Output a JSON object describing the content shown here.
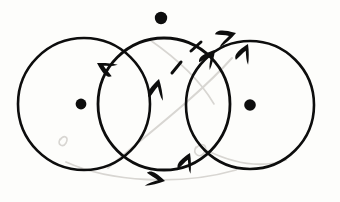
{
  "figure": {
    "kind": "hand-drawn-diagram",
    "width": 340,
    "height": 202,
    "background_color": "#fdfdfb",
    "ink_color": "#0d0d0d",
    "ghost_color": "#d8d6d2",
    "stroke_width": 2.6
  },
  "circles": [
    {
      "id": "left-circle",
      "label": "left circle",
      "cx": 84,
      "cy": 104,
      "r": 66,
      "stroke_width": 2.6
    },
    {
      "id": "middle-circle",
      "label": "middle circle",
      "cx": 164,
      "cy": 104,
      "r": 66,
      "stroke_width": 2.8
    },
    {
      "id": "right-circle",
      "label": "right circle",
      "cx": 250,
      "cy": 105,
      "r": 64,
      "stroke_width": 2.6
    }
  ],
  "dots": [
    {
      "id": "left-center-dot",
      "label": "left circle center point",
      "cx": 81,
      "cy": 104,
      "r": 5.4
    },
    {
      "id": "top-dot",
      "label": "top basepoint above middle circle",
      "cx": 161,
      "cy": 18,
      "r": 6.2
    },
    {
      "id": "right-center-dot",
      "label": "right circle center point",
      "cx": 250,
      "cy": 105,
      "r": 5.8
    }
  ],
  "arrowheads": [
    {
      "id": "arrow-upper-left",
      "label": "arrowhead on middle circle upper-left arc pointing down-left",
      "x": 97,
      "y": 63,
      "angle_deg": 218,
      "size": 15
    },
    {
      "id": "arrow-center-up",
      "label": "arrowhead on middle circle inner arc pointing up-left",
      "x": 159,
      "y": 79,
      "angle_deg": 293,
      "size": 16
    },
    {
      "id": "arrow-dashed-tip",
      "label": "arrowhead at tip of dashed path pointing up-right",
      "x": 215,
      "y": 50,
      "angle_deg": 318,
      "size": 15
    },
    {
      "id": "arrow-floating",
      "label": "detached floating arrowhead pointing right",
      "x": 236,
      "y": 33,
      "angle_deg": 352,
      "size": 16
    },
    {
      "id": "arrow-right-up",
      "label": "arrowhead on right circle upper-left arc pointing up-right",
      "x": 248,
      "y": 44,
      "angle_deg": 303,
      "size": 15
    },
    {
      "id": "arrow-bottom-up",
      "label": "arrowhead on middle circle lower-right arc pointing up-right",
      "x": 190,
      "y": 153,
      "angle_deg": 302,
      "size": 15
    },
    {
      "id": "arrow-bottom-right",
      "label": "arrowhead on lower arc pointing right",
      "x": 165,
      "y": 181,
      "angle_deg": 20,
      "size": 15
    }
  ],
  "dashes": [
    {
      "id": "dash-lower",
      "label": "lower dash segment of dashed path",
      "x1": 172,
      "y1": 73,
      "x2": 181,
      "y2": 62,
      "stroke_width": 3
    },
    {
      "id": "dash-upper",
      "label": "upper dash segment of dashed path",
      "x1": 191,
      "y1": 51,
      "x2": 201,
      "y2": 42,
      "stroke_width": 3
    }
  ],
  "ghost_marks": [
    {
      "id": "ghost-arc-diagonal",
      "label": "faint bleed-through diagonal arc",
      "d": "M 108 168 C 150 132 198 96 232 58",
      "stroke_width": 2
    },
    {
      "id": "ghost-arc-lower",
      "label": "faint bleed-through lower sweep",
      "d": "M 66 162 C 110 182 180 186 236 170",
      "stroke_width": 1.8
    },
    {
      "id": "ghost-arc-right",
      "label": "faint bleed-through right sweep",
      "d": "M 206 150 C 234 164 262 168 286 160",
      "stroke_width": 1.8
    },
    {
      "id": "ghost-squiggle-left",
      "label": "faint bleed-through squiggle left",
      "d": "M 60 140 c 4 -6 9 -3 6 3 c -3 5 -9 2 -6 -4",
      "stroke_width": 1.6
    },
    {
      "id": "ghost-squiggle-mid",
      "label": "faint bleed-through squiggle mid",
      "d": "M 196 148 c 6 -7 13 -2 8 5 c -4 6 -12 1 -8 -6",
      "stroke_width": 1.6
    },
    {
      "id": "ghost-arc-upper",
      "label": "faint bleed-through upper arc",
      "d": "M 150 40 C 176 58 200 80 214 104",
      "stroke_width": 1.6
    }
  ]
}
